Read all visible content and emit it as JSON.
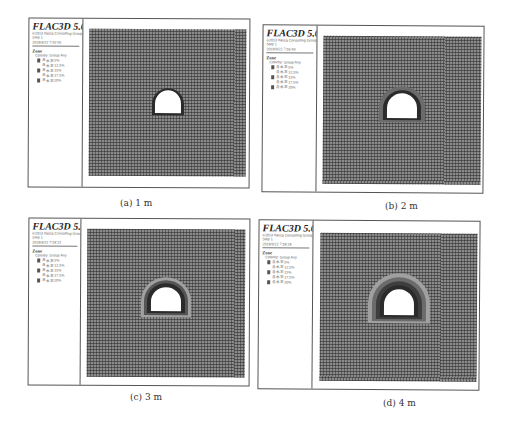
{
  "figure": {
    "panels": [
      {
        "id": "a",
        "caption": "(a)  1 m",
        "legend": {
          "title": "FLAC3D 5.00",
          "company": "©2013 Itasca Consulting Group, Inc.",
          "step": "Step 1",
          "timestamp": "2019/3/22 7:55:56",
          "zone_label": "Zone",
          "colorby": "Colorby: Group    Any",
          "items": [
            "含水率5%",
            "含水率12.5%",
            "含水率15%",
            "含水率17.5%",
            "含水率20%"
          ]
        },
        "rings": 1
      },
      {
        "id": "b",
        "caption": "(b)  2 m",
        "legend": {
          "title": "FLAC3D 5.00",
          "company": "©2013 Itasca Consulting Group, Inc.",
          "step": "Step 1",
          "timestamp": "2019/3/22 7:56:43",
          "zone_label": "Zone",
          "colorby": "Colorby: Group    Any",
          "items": [
            "含水率5%",
            "含水率12.5%",
            "含水率15%",
            "含水率17.5%",
            "含水率20%"
          ]
        },
        "rings": 2
      },
      {
        "id": "c",
        "caption": "(c)  3 m",
        "legend": {
          "title": "FLAC3D 5.00",
          "company": "©2013 Itasca Consulting Group, Inc.",
          "step": "Step 1",
          "timestamp": "2019/3/22 7:58:22",
          "zone_label": "Zone",
          "colorby": "Colorby: Group    Any",
          "items": [
            "含水率5%",
            "含水率12.5%",
            "含水率15%",
            "含水率17.5%",
            "含水率20%"
          ]
        },
        "rings": 3
      },
      {
        "id": "d",
        "caption": "(d)  4 m",
        "legend": {
          "title": "FLAC3D 5.00",
          "company": "©2013 Itasca Consulting Group, Inc.",
          "step": "Step 1",
          "timestamp": "2019/3/22 7:59:28",
          "zone_label": "Zone",
          "colorby": "Colorby: Group    Any",
          "items": [
            "含水率5%",
            "含水率12.5%",
            "含水率15%",
            "含水率17.5%",
            "含水率20%"
          ]
        },
        "rings": 4
      }
    ],
    "legend_swatch_colors": [
      "#555555",
      "#ffffff",
      "#555555",
      "#ffffff",
      "#555555"
    ],
    "ring_colors": [
      "#2b2b2b",
      "#6b6b6b",
      "#3e3e3e",
      "#a0a0a0",
      "#555555"
    ]
  }
}
